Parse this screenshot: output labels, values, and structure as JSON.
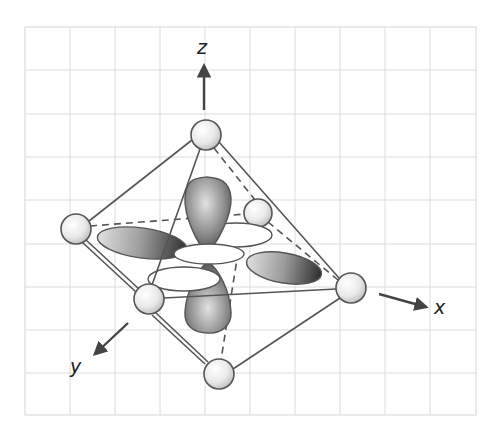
{
  "figure": {
    "axes": {
      "z": {
        "label": "z"
      },
      "x": {
        "label": "x"
      },
      "y": {
        "label": "y"
      }
    },
    "ligand_count": 6,
    "colors": {
      "grid": "#dcdcdc",
      "edge": "#555555",
      "lobe_dark": "#4a4a4a",
      "lobe_light": "#d8d8d8",
      "ligand_fill": "#eeeeee",
      "arrow": "#444444"
    }
  }
}
